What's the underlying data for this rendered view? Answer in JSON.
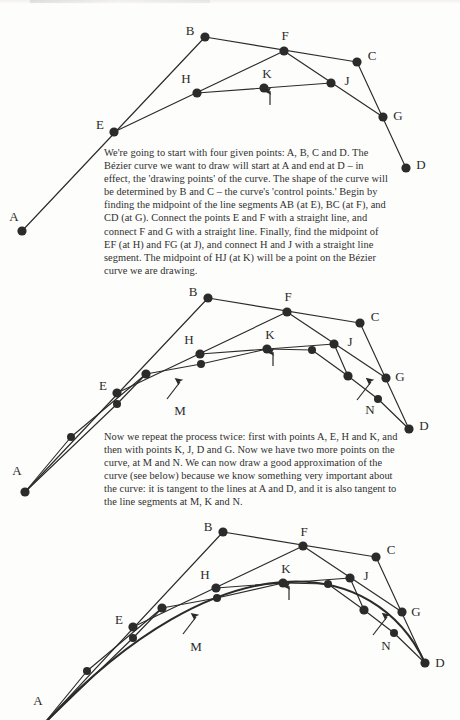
{
  "document": {
    "title": "Bezier Curve Construction — de Casteljau Subdivision",
    "type": "scanned-book-figure",
    "ink_color": "#2b2b2b",
    "paper_color": "#fdfdfc"
  },
  "panels": [
    {
      "id": "panel-1",
      "caption": "We're going to start with four given points: A, B, C and D. The Bézier curve we want to draw will start at A and end at D – in effect, the 'drawing points' of the curve. The shape of the curve will be determined by B and C – the curve's 'control points.' Begin by finding the midpoint of the line segments AB (at E), BC (at F), and CD (at G). Connect the points E and F with a straight line, and connect F and G with a straight line. Finally, find the midpoint of EF (at H) and FG (at J), and connect H and J with a straight line segment. The midpoint of HJ (at K) will be a point on the Bézier curve we are drawing.",
      "labels": [
        {
          "text": "A",
          "x": 14,
          "y": 216
        },
        {
          "text": "B",
          "x": 190,
          "y": 30
        },
        {
          "text": "C",
          "x": 372,
          "y": 55
        },
        {
          "text": "D",
          "x": 421,
          "y": 164
        },
        {
          "text": "E",
          "x": 100,
          "y": 124
        },
        {
          "text": "F",
          "x": 285,
          "y": 35
        },
        {
          "text": "G",
          "x": 398,
          "y": 115
        },
        {
          "text": "H",
          "x": 186,
          "y": 78
        },
        {
          "text": "J",
          "x": 347,
          "y": 80
        },
        {
          "text": "K",
          "x": 267,
          "y": 73
        }
      ],
      "points": [
        {
          "name": "A",
          "x": 22,
          "y": 231
        },
        {
          "name": "B",
          "x": 205,
          "y": 37
        },
        {
          "name": "C",
          "x": 357,
          "y": 62
        },
        {
          "name": "D",
          "x": 406,
          "y": 168
        },
        {
          "name": "E",
          "x": 114,
          "y": 132
        },
        {
          "name": "F",
          "x": 284,
          "y": 51
        },
        {
          "name": "G",
          "x": 383,
          "y": 117
        },
        {
          "name": "H",
          "x": 197,
          "y": 93
        },
        {
          "name": "J",
          "x": 331,
          "y": 83
        },
        {
          "name": "K",
          "x": 264,
          "y": 88
        }
      ],
      "segments": [
        {
          "from": "A",
          "to": "B"
        },
        {
          "from": "B",
          "to": "C"
        },
        {
          "from": "C",
          "to": "D"
        },
        {
          "from": "E",
          "to": "F"
        },
        {
          "from": "F",
          "to": "G"
        },
        {
          "from": "H",
          "to": "J"
        }
      ],
      "arrows": [
        {
          "label": "K",
          "from_x": 270,
          "from_y": 105,
          "to_x": 270,
          "to_y": 91
        }
      ],
      "curve": null
    },
    {
      "id": "panel-2",
      "caption": "Now we repeat the process twice: first with points A, E, H and K, and then with points K, J, D and G. Now we have two more points on the curve, at M and N. We can now draw a good approximation of the curve (see below) because we know something very important about the curve: it is tangent to the lines at A and D, and it is also tangent to the line segments at M, K and N.",
      "labels": [
        {
          "text": "A",
          "x": 17,
          "y": 470
        },
        {
          "text": "B",
          "x": 193,
          "y": 291
        },
        {
          "text": "C",
          "x": 375,
          "y": 316
        },
        {
          "text": "D",
          "x": 424,
          "y": 425
        },
        {
          "text": "E",
          "x": 103,
          "y": 385
        },
        {
          "text": "F",
          "x": 288,
          "y": 296
        },
        {
          "text": "G",
          "x": 400,
          "y": 376
        },
        {
          "text": "H",
          "x": 189,
          "y": 339
        },
        {
          "text": "J",
          "x": 350,
          "y": 341
        },
        {
          "text": "K",
          "x": 270,
          "y": 334
        },
        {
          "text": "M",
          "x": 180,
          "y": 410
        },
        {
          "text": "N",
          "x": 370,
          "y": 409
        }
      ],
      "points": [
        {
          "name": "A",
          "x": 25,
          "y": 492
        },
        {
          "name": "B",
          "x": 208,
          "y": 298
        },
        {
          "name": "C",
          "x": 360,
          "y": 323
        },
        {
          "name": "D",
          "x": 409,
          "y": 429
        },
        {
          "name": "E",
          "x": 117,
          "y": 393
        },
        {
          "name": "F",
          "x": 287,
          "y": 312
        },
        {
          "name": "G",
          "x": 386,
          "y": 378
        },
        {
          "name": "H",
          "x": 200,
          "y": 354
        },
        {
          "name": "J",
          "x": 334,
          "y": 344
        },
        {
          "name": "K",
          "x": 267,
          "y": 349
        },
        {
          "name": "M",
          "x": 146,
          "y": 374
        },
        {
          "name": "N",
          "x": 348,
          "y": 376
        },
        {
          "name": "A2",
          "x": 71,
          "y": 437
        },
        {
          "name": "E2",
          "x": 117,
          "y": 404
        },
        {
          "name": "H2",
          "x": 201,
          "y": 364
        },
        {
          "name": "J2",
          "x": 312,
          "y": 350
        },
        {
          "name": "G2",
          "x": 378,
          "y": 399
        }
      ],
      "segments": [
        {
          "from": "A",
          "to": "B"
        },
        {
          "from": "B",
          "to": "C"
        },
        {
          "from": "C",
          "to": "D"
        },
        {
          "from": "E",
          "to": "F"
        },
        {
          "from": "F",
          "to": "G"
        },
        {
          "from": "H",
          "to": "J"
        }
      ],
      "arrows": [
        {
          "label": "K",
          "from_x": 273,
          "from_y": 366,
          "to_x": 273,
          "to_y": 352
        },
        {
          "label": "M",
          "from_x": 167,
          "from_y": 399,
          "to_x": 180,
          "to_y": 382
        },
        {
          "label": "N",
          "from_x": 357,
          "from_y": 400,
          "to_x": 371,
          "to_y": 382
        }
      ],
      "curve": null
    },
    {
      "id": "panel-3",
      "caption": "",
      "labels": [
        {
          "text": "A",
          "x": 38,
          "y": 700
        },
        {
          "text": "B",
          "x": 208,
          "y": 526
        },
        {
          "text": "C",
          "x": 391,
          "y": 549
        },
        {
          "text": "D",
          "x": 440,
          "y": 662
        },
        {
          "text": "E",
          "x": 119,
          "y": 619
        },
        {
          "text": "F",
          "x": 304,
          "y": 531
        },
        {
          "text": "G",
          "x": 416,
          "y": 611
        },
        {
          "text": "H",
          "x": 205,
          "y": 574
        },
        {
          "text": "J",
          "x": 366,
          "y": 575
        },
        {
          "text": "K",
          "x": 286,
          "y": 568
        },
        {
          "text": "M",
          "x": 196,
          "y": 646
        },
        {
          "text": "N",
          "x": 386,
          "y": 645
        }
      ],
      "points": [
        {
          "name": "A",
          "x": 42,
          "y": 726
        },
        {
          "name": "B",
          "x": 223,
          "y": 532
        },
        {
          "name": "C",
          "x": 376,
          "y": 557
        },
        {
          "name": "D",
          "x": 425,
          "y": 663
        },
        {
          "name": "E",
          "x": 133,
          "y": 627
        },
        {
          "name": "F",
          "x": 303,
          "y": 546
        },
        {
          "name": "G",
          "x": 402,
          "y": 612
        },
        {
          "name": "H",
          "x": 216,
          "y": 588
        },
        {
          "name": "J",
          "x": 350,
          "y": 578
        },
        {
          "name": "K",
          "x": 283,
          "y": 583
        },
        {
          "name": "M",
          "x": 162,
          "y": 608
        },
        {
          "name": "N",
          "x": 364,
          "y": 610
        },
        {
          "name": "A2",
          "x": 87,
          "y": 671
        },
        {
          "name": "E2",
          "x": 133,
          "y": 638
        },
        {
          "name": "H2",
          "x": 217,
          "y": 598
        },
        {
          "name": "J2",
          "x": 328,
          "y": 584
        },
        {
          "name": "G2",
          "x": 394,
          "y": 633
        }
      ],
      "segments": [
        {
          "from": "A",
          "to": "B"
        },
        {
          "from": "B",
          "to": "C"
        },
        {
          "from": "C",
          "to": "D"
        },
        {
          "from": "E",
          "to": "F"
        },
        {
          "from": "F",
          "to": "G"
        },
        {
          "from": "H",
          "to": "J"
        }
      ],
      "arrows": [
        {
          "label": "K",
          "from_x": 289,
          "from_y": 600,
          "to_x": 289,
          "to_y": 586
        },
        {
          "label": "M",
          "from_x": 183,
          "from_y": 634,
          "to_x": 196,
          "to_y": 617
        },
        {
          "label": "N",
          "from_x": 373,
          "from_y": 635,
          "to_x": 387,
          "to_y": 617
        }
      ],
      "curve": {
        "type": "cubic-bezier",
        "start": {
          "x": 42,
          "y": 726
        },
        "control1": {
          "x": 223,
          "y": 532
        },
        "control2": {
          "x": 376,
          "y": 557
        },
        "end": {
          "x": 425,
          "y": 663
        }
      }
    }
  ]
}
